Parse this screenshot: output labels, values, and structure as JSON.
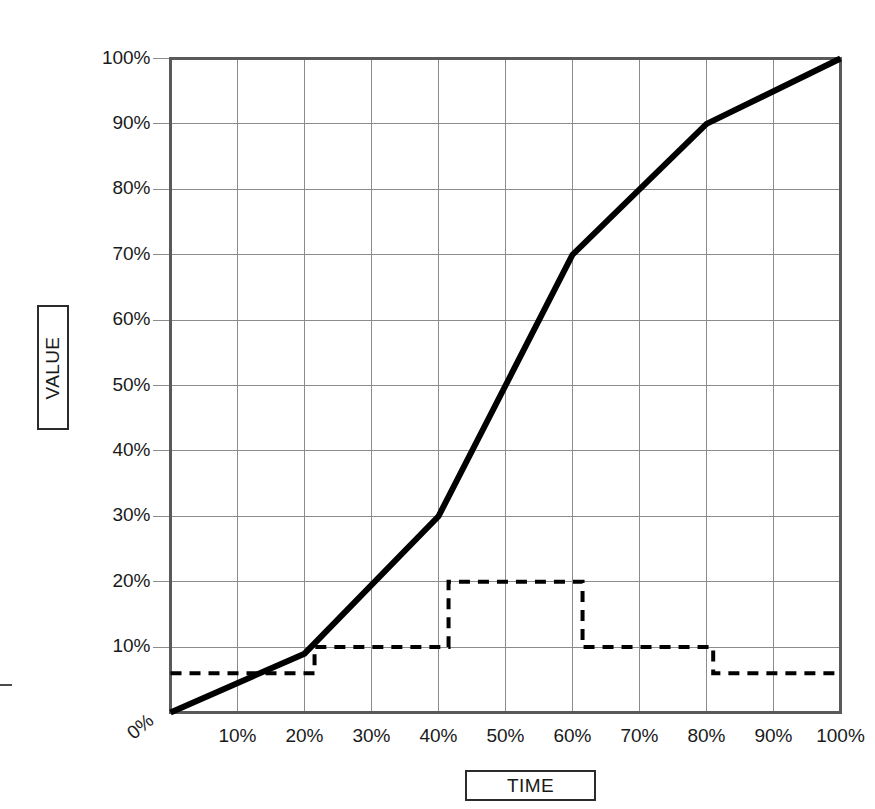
{
  "chart_data": {
    "type": "line",
    "title": "",
    "xlabel": "TIME",
    "ylabel": "VALUE",
    "xlim": [
      0,
      100
    ],
    "ylim": [
      0,
      100
    ],
    "grid": true,
    "legend": "none",
    "x_tick_labels": [
      "0%",
      "10%",
      "20%",
      "30%",
      "40%",
      "50%",
      "60%",
      "70%",
      "80%",
      "90%",
      "100%"
    ],
    "y_tick_labels": [
      "0%",
      "10%",
      "20%",
      "30%",
      "40%",
      "50%",
      "60%",
      "70%",
      "80%",
      "90%",
      "100%"
    ],
    "x_ticks": [
      0,
      10,
      20,
      30,
      40,
      50,
      60,
      70,
      80,
      90,
      100
    ],
    "y_ticks": [
      0,
      10,
      20,
      30,
      40,
      50,
      60,
      70,
      80,
      90,
      100
    ],
    "series": [
      {
        "name": "cumulative-s-curve",
        "style": "solid",
        "color": "#000000",
        "width": 6,
        "points": [
          [
            0,
            0
          ],
          [
            20,
            9
          ],
          [
            40,
            30
          ],
          [
            60,
            70
          ],
          [
            80,
            90
          ],
          [
            100,
            100
          ]
        ]
      },
      {
        "name": "period-step-rate",
        "style": "dashed",
        "color": "#000000",
        "width": 4,
        "points": [
          [
            0,
            6
          ],
          [
            21.5,
            6
          ],
          [
            21.5,
            10
          ],
          [
            41.5,
            10
          ],
          [
            41.5,
            20
          ],
          [
            61.5,
            20
          ],
          [
            61.5,
            10
          ],
          [
            81,
            10
          ],
          [
            81,
            6
          ],
          [
            100,
            6
          ]
        ]
      }
    ]
  },
  "axes": {
    "value_title": "VALUE",
    "time_title": "TIME"
  },
  "colors": {
    "grid": "#8c8c8c",
    "frame": "#5a5a5a",
    "series_primary": "#000000",
    "series_secondary": "#000000",
    "background": "#ffffff"
  }
}
